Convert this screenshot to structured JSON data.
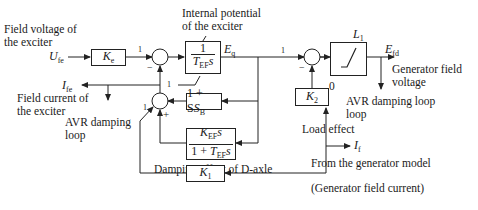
{
  "labels": {
    "field_voltage": "Field voltage of",
    "field_voltage_2": "the exciter",
    "field_current": "Field current of",
    "field_current_2": "the exciter",
    "internal_potential": "Internal potential",
    "internal_potential_2": "of the exciter",
    "gen_field_voltage": "Generator field",
    "gen_field_voltage_2": "voltage",
    "avr_damping_right": "AVR damping loop",
    "avr_damping_right_2": "loop",
    "avr_damping_left": "AVR damping",
    "avr_damping_left_2": "loop",
    "load_effect": "Load effect",
    "from_gen_model": "From the generator model",
    "damping_d_axle": "Damping effect of D-axle",
    "gen_field_current": "(Generator field current)",
    "zero": "0"
  },
  "signals": {
    "ufe": {
      "main": "U",
      "sub": "fe"
    },
    "ife": {
      "main": "I",
      "sub": "fe"
    },
    "eq": {
      "main": "E",
      "sub": "q"
    },
    "efd": {
      "main": "E",
      "sub": "fd"
    },
    "if": {
      "main": "I",
      "sub": "f"
    }
  },
  "blocks": {
    "ke": {
      "main": "K",
      "sub": "e"
    },
    "integrator": {
      "num": "1",
      "den_main": "T",
      "den_sub": "EF",
      "den_tail": "s"
    },
    "saturation": {
      "text": "1 + S",
      "sub": "B"
    },
    "damping": {
      "num_main": "K",
      "num_sub": "EF",
      "num_tail": "s",
      "den_pre": "1 + ",
      "den_main": "T",
      "den_sub": "EF",
      "den_tail": "s"
    },
    "k1": {
      "main": "K",
      "sub": "1"
    },
    "k2": {
      "main": "K",
      "sub": "2"
    },
    "limiter": {
      "main": "L",
      "sub": "1"
    }
  },
  "signs": {
    "sum1_in": "1",
    "sum1_minus": "−",
    "sum1_fb": "1",
    "sum2_in": "1",
    "sum2_plus": "+",
    "sum3_in": "1",
    "sum3_minus": "−"
  }
}
